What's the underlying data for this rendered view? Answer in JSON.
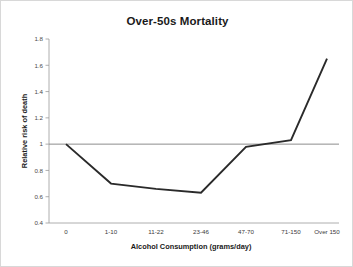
{
  "chart_data": {
    "type": "line",
    "title": "Over-50s Mortality",
    "xlabel": "Alcohol Consumption (grams/day)",
    "ylabel": "Relative risk of death",
    "categories": [
      "0",
      "1-10",
      "11-22",
      "23-46",
      "47-70",
      "71-150",
      "Over 150"
    ],
    "values": [
      1.0,
      0.7,
      0.66,
      0.63,
      0.98,
      1.03,
      1.65
    ],
    "series": [
      {
        "name": "Relative risk of death",
        "values": [
          1.0,
          0.7,
          0.66,
          0.63,
          0.98,
          1.03,
          1.65
        ]
      }
    ],
    "reference_line": {
      "label": "baseline",
      "value": 1.0,
      "color": "#8c8c8c"
    },
    "ylim": [
      0.4,
      1.8
    ],
    "yticks": [
      "0.4",
      "0.6",
      "0.8",
      "1",
      "1.2",
      "1.4",
      "1.6",
      "1.8"
    ],
    "ytick_values": [
      0.4,
      0.6,
      0.8,
      1.0,
      1.2,
      1.4,
      1.6,
      1.8
    ],
    "grid": false,
    "legend": "none",
    "line_color": "#2a2a2a"
  }
}
